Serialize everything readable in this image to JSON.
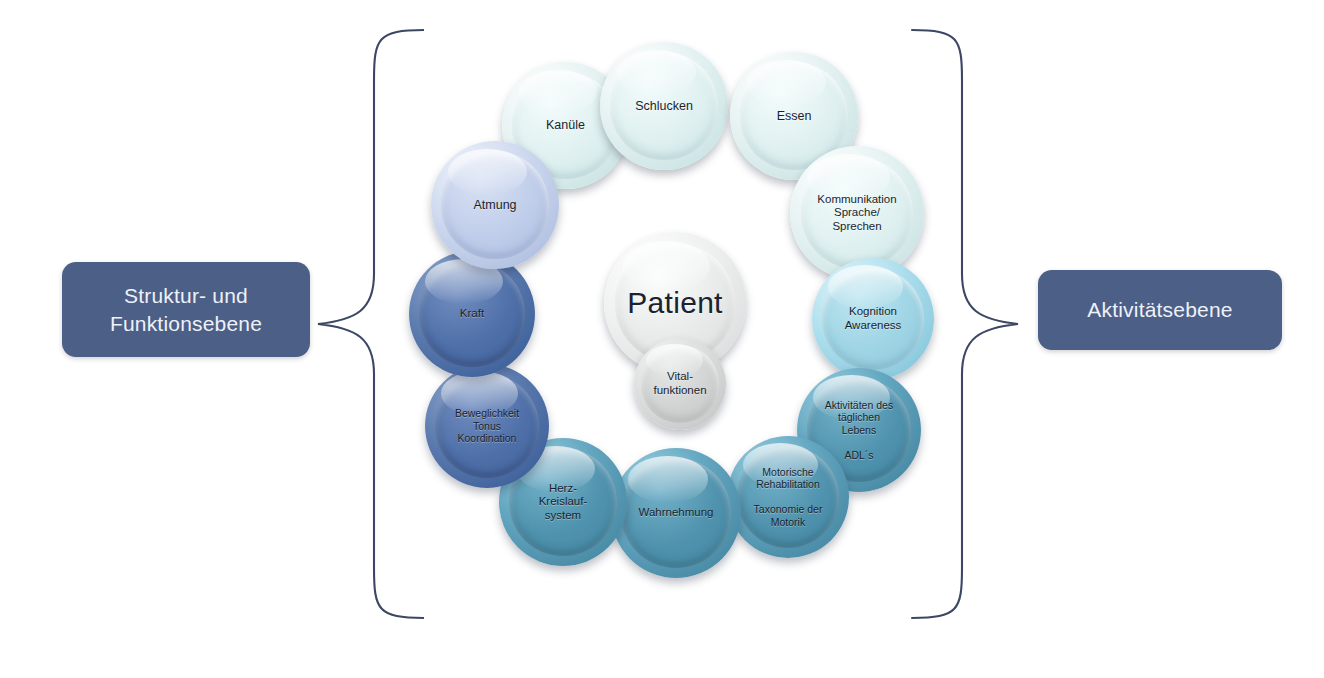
{
  "diagram": {
    "title_center": "Patient",
    "levels": {
      "left": {
        "label": "Struktur- und\nFunktionsebene",
        "color": "#4c5f87"
      },
      "right": {
        "label": "Aktivitätsebene",
        "color": "#4c5f87"
      }
    },
    "center_nodes": [
      {
        "id": "patient",
        "label": "Patient"
      },
      {
        "id": "vitalfunktionen",
        "label": "Vital-\nfunktionen"
      }
    ],
    "ring_nodes": [
      {
        "id": "kanuele",
        "label": "Kanüle",
        "color": "#dff0f0"
      },
      {
        "id": "schlucken",
        "label": "Schlucken",
        "color": "#dff0f0"
      },
      {
        "id": "essen",
        "label": "Essen",
        "color": "#dff0f0"
      },
      {
        "id": "kommunikation",
        "label": "Kommunikation\nSprache/\nSprechen",
        "color": "#dff0f0"
      },
      {
        "id": "kognition",
        "label": "Kognition\nAwareness",
        "color": "#9ed4e4"
      },
      {
        "id": "adl",
        "label": "Aktivitäten des\ntäglichen\nLebens\n\nADL´s",
        "color": "#4f92ad"
      },
      {
        "id": "motorik",
        "label": "Motorische\nRehabilitation\n\nTaxonomie der\nMotorik",
        "color": "#4f92ad"
      },
      {
        "id": "wahrnehmung",
        "label": "Wahrnehmung",
        "color": "#4f92ad"
      },
      {
        "id": "herzkreislauf",
        "label": "Herz-\nKreislauf-\nsystem",
        "color": "#4f92ad"
      },
      {
        "id": "beweglichkeit",
        "label": "Beweglichkeit\nTonus\nKoordination",
        "color": "#4e6fa8"
      },
      {
        "id": "kraft",
        "label": "Kraft",
        "color": "#4e6fa8"
      },
      {
        "id": "atmung",
        "label": "Atmung",
        "color": "#bfcdea"
      }
    ]
  }
}
